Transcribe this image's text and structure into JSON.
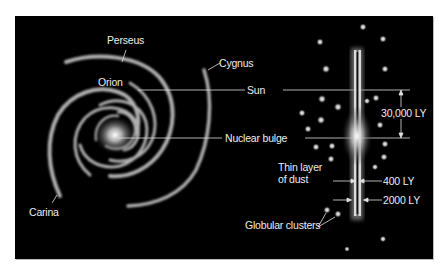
{
  "colors": {
    "background": "#000000",
    "label": "#ededed",
    "arm": "#d8d8d8",
    "page": "#ffffff"
  },
  "face_on": {
    "arm_labels": [
      {
        "name": "Perseus"
      },
      {
        "name": "Cygnus"
      },
      {
        "name": "Orion"
      },
      {
        "name": "Carina"
      }
    ]
  },
  "markers": {
    "sun": "Sun",
    "nuclear_bulge": "Nuclear bulge"
  },
  "edge_on": {
    "bulge_height": "30,000 LY",
    "dust_label_line1": "Thin layer",
    "dust_label_line2": "of dust",
    "dust_thickness": "400 LY",
    "disk_thickness": "2000 LY",
    "globular_clusters": "Globular clusters"
  }
}
